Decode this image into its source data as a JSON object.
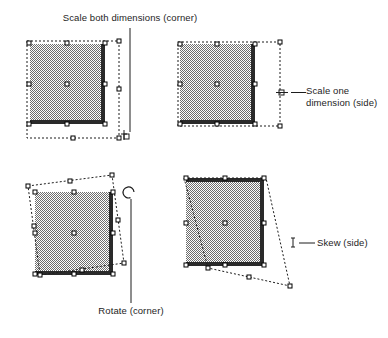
{
  "figure": {
    "title_caption": "Scale both dimensions (corner)",
    "background_color": "#ffffff",
    "ink_color": "#1d1d1d",
    "shape_fill_color": "#808080",
    "handle_fill_color": "#ffffff",
    "handle_stroke_color": "#000000"
  },
  "panels": [
    {
      "id": "scale-corner",
      "label": "Scale both dimensions (corner)",
      "label_lines": [
        "Scale both dimensions (corner)"
      ],
      "label_position": "top",
      "cursor_icon": "scale-diagonal-corner-cursor",
      "handle_count": 9,
      "handle_names": [
        "handle-top-left",
        "handle-top-center",
        "handle-top-right",
        "handle-middle-left",
        "handle-center",
        "handle-middle-right",
        "handle-bottom-left",
        "handle-bottom-center",
        "handle-bottom-right"
      ],
      "transform_description": "dashed bounding box scaled larger in both width and height from the corner"
    },
    {
      "id": "scale-side",
      "label_lines": [
        "Scale one",
        "dimension (side)"
      ],
      "label": "Scale one dimension (side)",
      "label_position": "right",
      "cursor_icon": "scale-horizontal-side-cursor",
      "handle_count": 9,
      "handle_names": [
        "handle-top-left",
        "handle-top-center",
        "handle-top-right",
        "handle-middle-left",
        "handle-center",
        "handle-middle-right",
        "handle-bottom-left",
        "handle-bottom-center",
        "handle-bottom-right"
      ],
      "transform_description": "dashed bounding box stretched horizontally only, from the middle-right side handle"
    },
    {
      "id": "rotate-corner",
      "label_lines": [
        "Rotate (corner)"
      ],
      "label": "Rotate (corner)",
      "label_position": "bottom",
      "cursor_icon": "rotate-circular-arrow-cursor",
      "handle_count": 9,
      "handle_names": [
        "handle-top-left",
        "handle-top-center",
        "handle-top-right",
        "handle-middle-left",
        "handle-center",
        "handle-middle-right",
        "handle-bottom-left",
        "handle-bottom-center",
        "handle-bottom-right"
      ],
      "transform_description": "dashed bounding box rotated counter-clockwise about the center point, dragged from a corner handle"
    },
    {
      "id": "skew-side",
      "label_lines": [
        "Skew (side)"
      ],
      "label": "Skew (side)",
      "label_position": "right",
      "cursor_icon": "skew-ibeam-cursor",
      "handle_count": 9,
      "handle_names": [
        "handle-top-left",
        "handle-top-center",
        "handle-top-right",
        "handle-middle-left",
        "handle-center",
        "handle-middle-right",
        "handle-bottom-left",
        "handle-bottom-center",
        "handle-bottom-right"
      ],
      "transform_description": "dashed bounding box skewed, bottom edge slid sideways from the bottom side handle"
    }
  ]
}
